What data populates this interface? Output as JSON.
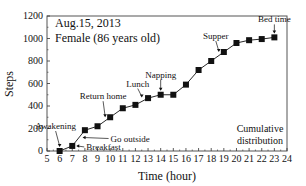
{
  "chart_data": {
    "type": "line",
    "title": "",
    "annotation_date": "Aug.15, 2013",
    "annotation_subject": "Female (86 years old)",
    "annotation_note_line1": "Cumulative",
    "annotation_note_line2": "distribution",
    "xlabel": "Time (hour)",
    "ylabel": "Steps",
    "xlim": [
      5,
      24
    ],
    "ylim": [
      0,
      1200
    ],
    "x_ticks": [
      5,
      6,
      7,
      8,
      9,
      10,
      11,
      12,
      13,
      14,
      15,
      16,
      17,
      18,
      19,
      20,
      21,
      22,
      23,
      24
    ],
    "y_ticks": [
      0,
      200,
      400,
      600,
      800,
      1000,
      1200
    ],
    "grid": false,
    "legend": null,
    "series": [
      {
        "name": "Cumulative steps",
        "marker": "square",
        "x": [
          6,
          7,
          8,
          9,
          10,
          11,
          12,
          13,
          14,
          15,
          16,
          17,
          18,
          19,
          20,
          21,
          22,
          23
        ],
        "values": [
          0,
          45,
          185,
          220,
          300,
          380,
          410,
          470,
          500,
          500,
          590,
          720,
          800,
          880,
          960,
          985,
          995,
          1010
        ]
      }
    ],
    "event_annotations": [
      {
        "label": "Awakening",
        "x": 6.0,
        "y": 0
      },
      {
        "label": "Breakfast",
        "x": 7.0,
        "y": 45
      },
      {
        "label": "Go outside",
        "x": 7.5,
        "y": 120
      },
      {
        "label": "Return home",
        "x": 9.6,
        "y": 265
      },
      {
        "label": "Lunch",
        "x": 12.5,
        "y": 440
      },
      {
        "label": "Napping",
        "x": 14.0,
        "y": 500
      },
      {
        "label": "Supper",
        "x": 18.6,
        "y": 845
      },
      {
        "label": "Bed time",
        "x": 23.0,
        "y": 1010
      }
    ]
  }
}
